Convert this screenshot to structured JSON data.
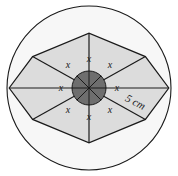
{
  "figure": {
    "background_color": "#ffffff",
    "colors": {
      "octagon_fill": "#dcdcdc",
      "circle_fill": "#f7f7f7",
      "hub_fill": "#6e6e6e",
      "stroke": "#1a1a1a",
      "text": "#1a1a1a"
    },
    "geometry": {
      "center_x": 89,
      "center_y": 88,
      "circle_radius": 82,
      "hub_radius": 17,
      "octagon_sides": 8,
      "octagon_rotation_deg": 22.5
    }
  },
  "labels": {
    "radius_label": "5 cm",
    "radius_label_angle_deg": 27,
    "angle_symbol": "x",
    "angles": [
      {
        "name": "angle-top",
        "text": "x",
        "x": 89,
        "y": 59
      },
      {
        "name": "angle-top-right",
        "text": "x",
        "x": 110,
        "y": 65
      },
      {
        "name": "angle-right",
        "text": "x",
        "x": 117,
        "y": 88
      },
      {
        "name": "angle-bottom-right",
        "text": "x",
        "x": 110,
        "y": 110
      },
      {
        "name": "angle-bottom",
        "text": "x",
        "x": 89,
        "y": 117
      },
      {
        "name": "angle-bottom-left",
        "text": "x",
        "x": 68,
        "y": 110
      },
      {
        "name": "angle-left",
        "text": "x",
        "x": 61,
        "y": 88
      },
      {
        "name": "angle-top-left",
        "text": "x",
        "x": 68,
        "y": 65
      }
    ]
  }
}
